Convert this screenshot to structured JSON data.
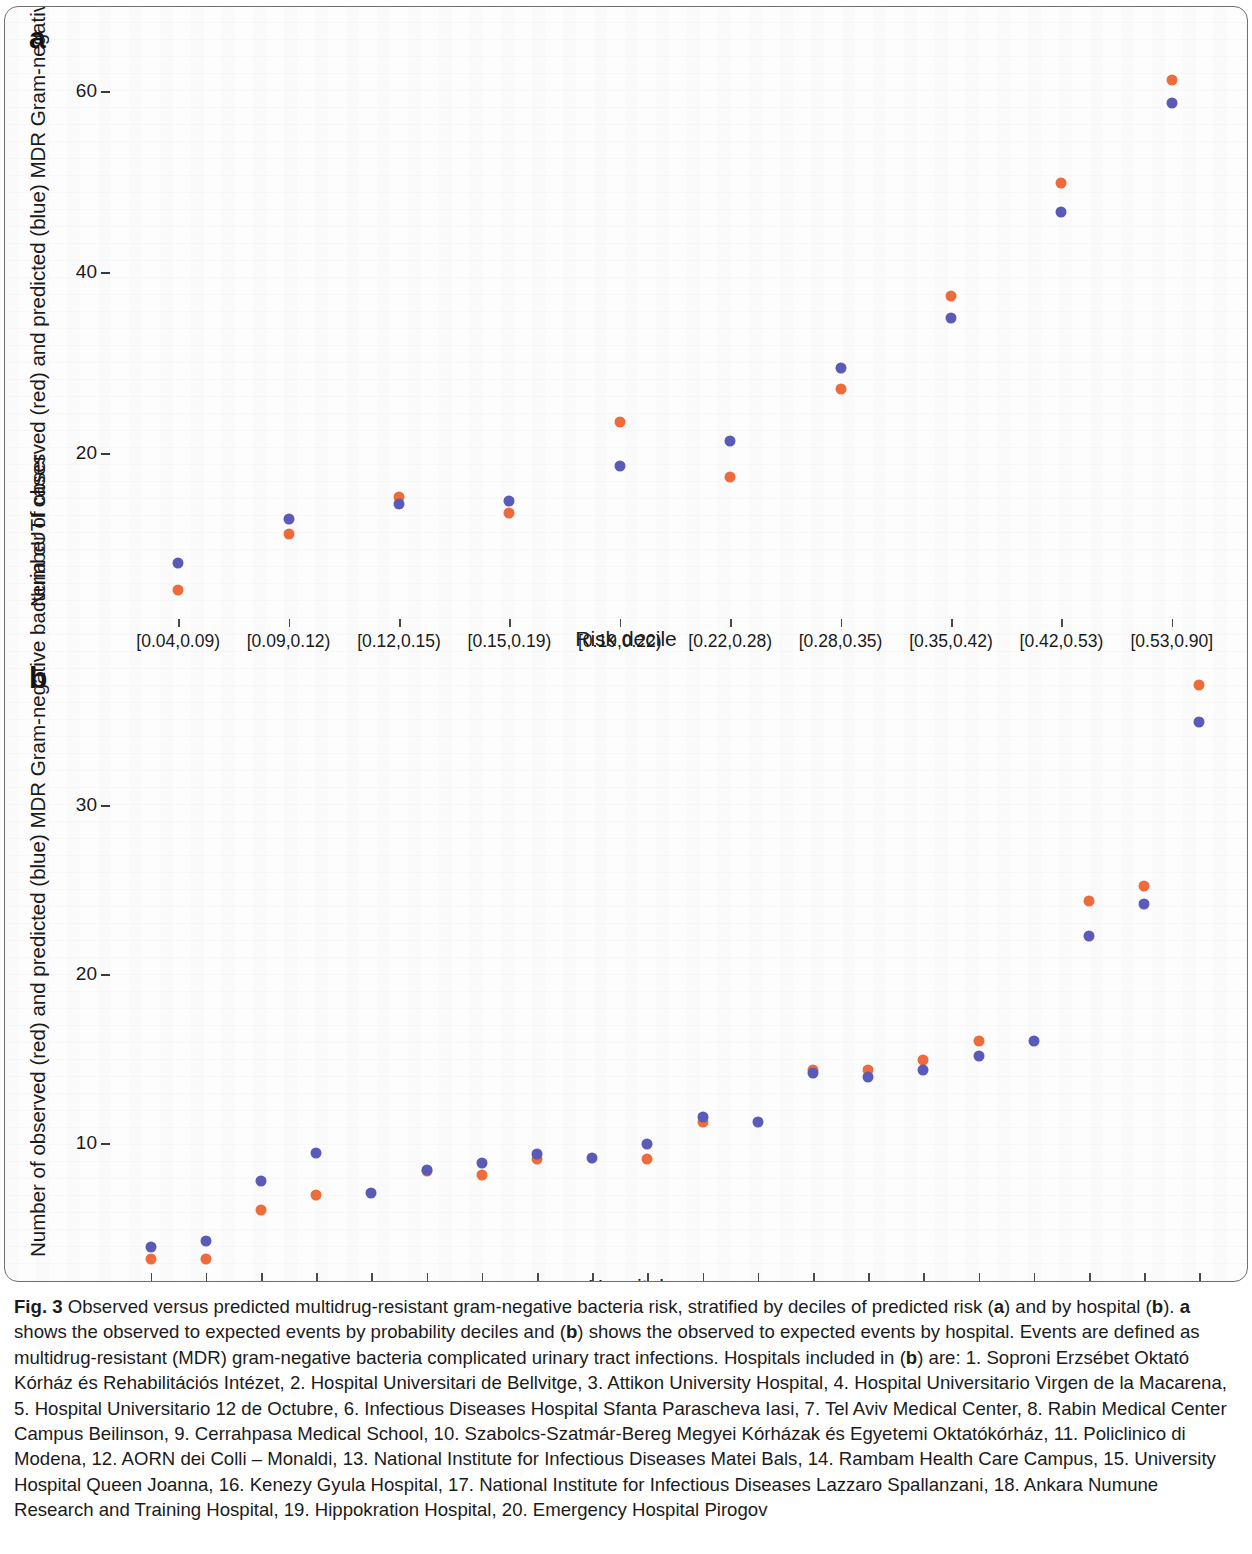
{
  "figure": {
    "panel_a_letter": "a",
    "panel_b_letter": "b",
    "caption_label": "Fig. 3",
    "caption_text": " Observed versus predicted multidrug-resistant gram-negative bacteria risk, stratified by deciles of predicted risk (a) and by hospital (b). a shows the observed to expected events by probability deciles and (b) shows the observed to expected events by hospital. Events are defined as multidrug-resistant (MDR) gram-negative bacteria complicated urinary tract infections. Hospitals included in (b) are: 1. Soproni Erzsébet Oktató Kórház és Rehabilitációs Intézet, 2. Hospital Universitari de Bellvitge, 3. Attikon University Hospital, 4. Hospital Universitario Virgen de la Macarena, 5. Hospital Universitario 12 de Octubre, 6. Infectious Diseases Hospital Sfanta Parascheva Iasi, 7. Tel Aviv Medical Center, 8. Rabin Medical Center Campus Beilinson, 9. Cerrahpasa Medical School, 10. Szabolcs-Szatmár-Bereg Megyei Kórházak és Egyetemi Oktatókórház, 11. Policlinico di Modena, 12. AORN dei Colli – Monaldi, 13. National Institute for Infectious Diseases Matei Bals, 14. Rambam Health Care Campus, 15. University Hospital Queen Joanna, 16. Kenezy Gyula Hospital, 17. National Institute for Infectious Diseases Lazzaro Spallanzani, 18. Ankara Numune Research and Training Hospital, 19. Hippokration Hospital, 20. Emergency Hospital Pirogov"
  },
  "colors": {
    "observed_red": "#EE6B3B",
    "predicted_blue": "#5A5AB8",
    "axis": "#3a3a3a",
    "text": "#1a1a1a"
  },
  "chart_data": [
    {
      "panel": "a",
      "type": "scatter",
      "title": "",
      "xlabel": "Risk decile",
      "ylabel": "Number of observed (red) and predicted (blue) MDR Gram-negative bacteria cUTI cases",
      "categories": [
        "[0.04,0.09)",
        "[0.09,0.12)",
        "[0.12,0.15)",
        "[0.15,0.19)",
        "[0.19,0.22)",
        "[0.22,0.28)",
        "[0.28,0.35)",
        "[0.35,0.42)",
        "[0.42,0.53)",
        "[0.53,0.90]"
      ],
      "yticks": [
        20,
        40,
        60
      ],
      "ylim": [
        2,
        65
      ],
      "grid": false,
      "legend": "encoded in axis label: red = observed, blue = predicted",
      "series": [
        {
          "name": "Observed (red)",
          "color": "#EE6B3B",
          "values": [
            5.0,
            11.2,
            15.3,
            13.5,
            23.5,
            17.5,
            27.2,
            37.5,
            50.0,
            61.3
          ]
        },
        {
          "name": "Predicted (blue)",
          "color": "#5A5AB8",
          "values": [
            8.0,
            12.8,
            14.5,
            14.8,
            18.7,
            21.5,
            29.5,
            35.0,
            46.8,
            58.8
          ]
        }
      ]
    },
    {
      "panel": "b",
      "type": "scatter",
      "title": "",
      "xlabel": "Hospital",
      "ylabel": "Number of observed (red) and predicted (blue) MDR Gram-negative bacteria cUTI cases",
      "categories": [
        "1",
        "2",
        "3",
        "4",
        "5",
        "6",
        "7",
        "8",
        "9",
        "10",
        "11",
        "12",
        "13",
        "14",
        "15",
        "16",
        "17",
        "18",
        "19",
        "20"
      ],
      "yticks": [
        10,
        20,
        30
      ],
      "ylim": [
        2.5,
        38
      ],
      "grid": false,
      "legend": "encoded in axis label: red = observed, blue = predicted",
      "series": [
        {
          "name": "Observed (red)",
          "color": "#EE6B3B",
          "values": [
            3.2,
            3.2,
            6.1,
            7.0,
            null,
            8.4,
            8.2,
            9.1,
            null,
            9.1,
            11.3,
            null,
            14.4,
            14.4,
            15.0,
            16.1,
            null,
            24.4,
            25.3,
            37.2
          ]
        },
        {
          "name": "Predicted (blue)",
          "color": "#5A5AB8",
          "values": [
            3.9,
            4.3,
            7.8,
            9.5,
            7.1,
            8.5,
            8.9,
            9.4,
            9.2,
            10.0,
            11.6,
            11.3,
            14.2,
            14.0,
            14.4,
            15.2,
            16.1,
            22.3,
            24.2,
            35.0
          ]
        }
      ]
    }
  ]
}
